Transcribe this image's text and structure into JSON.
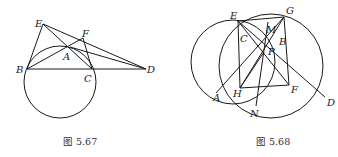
{
  "figures": [
    {
      "id": "fig-5-67",
      "caption": "图 5.67",
      "points": {
        "E": "E",
        "F": "F",
        "A": "A",
        "B": "B",
        "C": "C",
        "D": "D"
      }
    },
    {
      "id": "fig-5-68",
      "caption": "图 5.68",
      "points": {
        "E": "E",
        "G": "G",
        "M": "M",
        "C": "C",
        "B": "B",
        "P": "P",
        "A": "A",
        "H": "H",
        "F": "F",
        "N": "N",
        "D": "D"
      }
    }
  ]
}
